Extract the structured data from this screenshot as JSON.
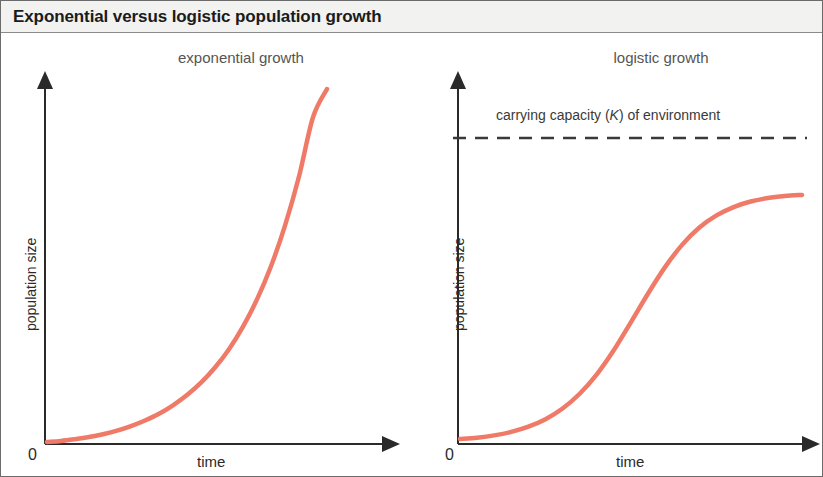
{
  "figure": {
    "title": "Exponential versus logistic population growth",
    "background_color": "#ffffff",
    "border_color": "#6b6b6b",
    "title_bar_color": "#f2f2f0"
  },
  "panels": {
    "left": {
      "title": "exponential growth",
      "xlabel": "time",
      "ylabel": "population size",
      "origin_label": "0"
    },
    "right": {
      "title": "logistic growth",
      "xlabel": "time",
      "ylabel": "population size",
      "origin_label": "0",
      "annotation_prefix": "carrying capacity (",
      "annotation_symbol": "K",
      "annotation_suffix": ") of environment"
    }
  },
  "chart_data": [
    {
      "type": "line",
      "title": "exponential growth",
      "xlabel": "time",
      "ylabel": "population size",
      "xlim": [
        0,
        1
      ],
      "ylim": [
        0,
        1
      ],
      "grid": false,
      "legend": "none",
      "axis_tick_labels": [
        "0"
      ],
      "line_color": "#f07a68",
      "line_width": 4,
      "series": [
        {
          "name": "exponential growth",
          "x": [
            0,
            0.05,
            0.1,
            0.15,
            0.2,
            0.25,
            0.3,
            0.35,
            0.4,
            0.45,
            0.5,
            0.55,
            0.6,
            0.65,
            0.7,
            0.75,
            0.8,
            0.85,
            0.9,
            0.95,
            1.0
          ],
          "y": [
            0.0,
            0.003,
            0.008,
            0.014,
            0.022,
            0.032,
            0.045,
            0.061,
            0.08,
            0.104,
            0.133,
            0.168,
            0.211,
            0.263,
            0.327,
            0.404,
            0.498,
            0.613,
            0.752,
            0.92,
            1.0
          ]
        }
      ]
    },
    {
      "type": "line",
      "title": "logistic growth",
      "xlabel": "time",
      "ylabel": "population size",
      "xlim": [
        0,
        1
      ],
      "ylim": [
        0,
        1
      ],
      "grid": false,
      "legend": "none",
      "axis_tick_labels": [
        "0"
      ],
      "line_color": "#f07a68",
      "line_width": 4,
      "carrying_capacity": 0.88,
      "carrying_capacity_style": "dashed",
      "carrying_capacity_label": "carrying capacity (K) of environment",
      "series": [
        {
          "name": "logistic growth",
          "x": [
            0,
            0.05,
            0.1,
            0.15,
            0.2,
            0.25,
            0.3,
            0.35,
            0.4,
            0.45,
            0.5,
            0.55,
            0.6,
            0.65,
            0.7,
            0.75,
            0.8,
            0.85,
            0.9,
            0.95,
            1.0
          ],
          "y": [
            0.01,
            0.015,
            0.023,
            0.035,
            0.053,
            0.079,
            0.116,
            0.167,
            0.234,
            0.318,
            0.415,
            0.514,
            0.606,
            0.683,
            0.742,
            0.784,
            0.813,
            0.832,
            0.844,
            0.851,
            0.855
          ]
        }
      ]
    }
  ]
}
